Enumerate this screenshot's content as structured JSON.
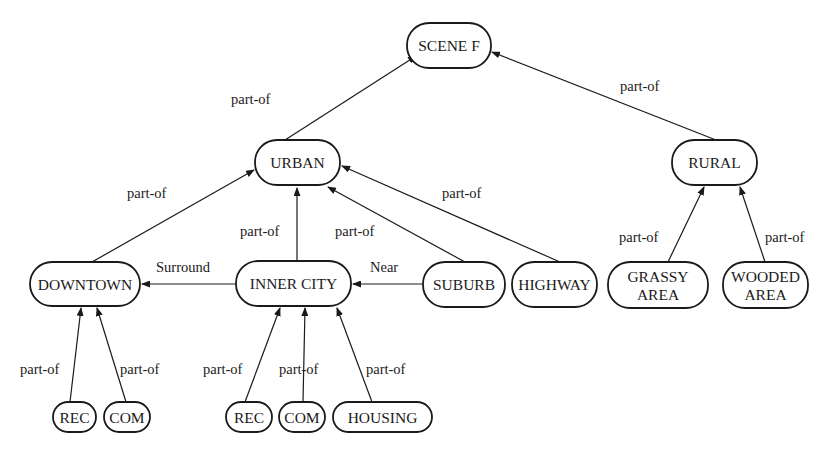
{
  "diagram": {
    "colors": {
      "stroke": "#1a1a1a",
      "background": "#ffffff"
    },
    "nodes": [
      {
        "id": "scene_f",
        "label": [
          "SCENE F"
        ],
        "x": 407,
        "y": 23,
        "w": 84,
        "h": 45
      },
      {
        "id": "urban",
        "label": [
          "URBAN"
        ],
        "x": 255,
        "y": 140,
        "w": 85,
        "h": 45
      },
      {
        "id": "rural",
        "label": [
          "RURAL"
        ],
        "x": 672,
        "y": 140,
        "w": 85,
        "h": 45
      },
      {
        "id": "downtown",
        "label": [
          "DOWNTOWN"
        ],
        "x": 30,
        "y": 262,
        "w": 110,
        "h": 44
      },
      {
        "id": "inner_city",
        "label": [
          "INNER CITY"
        ],
        "x": 236,
        "y": 261,
        "w": 115,
        "h": 45
      },
      {
        "id": "suburb",
        "label": [
          "SUBURB"
        ],
        "x": 423,
        "y": 262,
        "w": 82,
        "h": 45
      },
      {
        "id": "highway",
        "label": [
          "HIGHWAY"
        ],
        "x": 512,
        "y": 262,
        "w": 85,
        "h": 45
      },
      {
        "id": "grassy",
        "label": [
          "GRASSY",
          "AREA"
        ],
        "x": 608,
        "y": 262,
        "w": 100,
        "h": 46
      },
      {
        "id": "wooded",
        "label": [
          "WOODED",
          "AREA"
        ],
        "x": 723,
        "y": 262,
        "w": 85,
        "h": 46
      },
      {
        "id": "rec1",
        "label": [
          "REC"
        ],
        "x": 53,
        "y": 402,
        "w": 43,
        "h": 30
      },
      {
        "id": "com1",
        "label": [
          "COM"
        ],
        "x": 104,
        "y": 402,
        "w": 46,
        "h": 30
      },
      {
        "id": "rec2",
        "label": [
          "REC"
        ],
        "x": 226,
        "y": 402,
        "w": 46,
        "h": 30
      },
      {
        "id": "com2",
        "label": [
          "COM"
        ],
        "x": 279,
        "y": 402,
        "w": 46,
        "h": 30
      },
      {
        "id": "housing",
        "label": [
          "HOUSING"
        ],
        "x": 333,
        "y": 402,
        "w": 99,
        "h": 30
      }
    ],
    "edges": [
      {
        "from": "urban",
        "to": "scene_f",
        "label": "part-of",
        "x1": 285,
        "y1": 140,
        "x2": 416,
        "y2": 56,
        "lx": 231,
        "ly": 104
      },
      {
        "from": "rural",
        "to": "scene_f",
        "label": "part-of",
        "x1": 716,
        "y1": 140,
        "x2": 492,
        "y2": 52,
        "lx": 620,
        "ly": 91
      },
      {
        "from": "downtown",
        "to": "urban",
        "label": "part-of",
        "x1": 92,
        "y1": 262,
        "x2": 254,
        "y2": 170,
        "lx": 127,
        "ly": 198
      },
      {
        "from": "inner_city",
        "to": "urban",
        "label": "part-of",
        "x1": 297,
        "y1": 261,
        "x2": 297,
        "y2": 188,
        "lx": 240,
        "ly": 236
      },
      {
        "from": "suburb",
        "to": "urban",
        "label": "part-of",
        "x1": 465,
        "y1": 262,
        "x2": 328,
        "y2": 187,
        "lx": 335,
        "ly": 236
      },
      {
        "from": "highway",
        "to": "urban",
        "label": "part-of",
        "x1": 560,
        "y1": 262,
        "x2": 342,
        "y2": 166,
        "lx": 442,
        "ly": 198
      },
      {
        "from": "inner_city",
        "to": "downtown",
        "label": "Surround",
        "x1": 236,
        "y1": 284,
        "x2": 142,
        "y2": 284,
        "lx": 156,
        "ly": 272
      },
      {
        "from": "suburb",
        "to": "inner_city",
        "label": "Near",
        "x1": 423,
        "y1": 284,
        "x2": 353,
        "y2": 284,
        "lx": 370,
        "ly": 272
      },
      {
        "from": "grassy",
        "to": "rural",
        "label": "part-of",
        "x1": 668,
        "y1": 262,
        "x2": 704,
        "y2": 187,
        "lx": 619,
        "ly": 242
      },
      {
        "from": "wooded",
        "to": "rural",
        "label": "part-of",
        "x1": 765,
        "y1": 262,
        "x2": 740,
        "y2": 187,
        "lx": 765,
        "ly": 242
      },
      {
        "from": "rec1",
        "to": "downtown",
        "label": "part-of",
        "x1": 70,
        "y1": 402,
        "x2": 81,
        "y2": 308,
        "lx": 20,
        "ly": 374
      },
      {
        "from": "com1",
        "to": "downtown",
        "label": "part-of",
        "x1": 126,
        "y1": 402,
        "x2": 97,
        "y2": 308,
        "lx": 120,
        "ly": 374
      },
      {
        "from": "rec2",
        "to": "inner_city",
        "label": "part-of",
        "x1": 245,
        "y1": 402,
        "x2": 280,
        "y2": 308,
        "lx": 203,
        "ly": 374
      },
      {
        "from": "com2",
        "to": "inner_city",
        "label": "part-of",
        "x1": 303,
        "y1": 402,
        "x2": 305,
        "y2": 308,
        "lx": 279,
        "ly": 374
      },
      {
        "from": "housing",
        "to": "inner_city",
        "label": "part-of",
        "x1": 372,
        "y1": 402,
        "x2": 337,
        "y2": 308,
        "lx": 366,
        "ly": 374
      }
    ]
  }
}
